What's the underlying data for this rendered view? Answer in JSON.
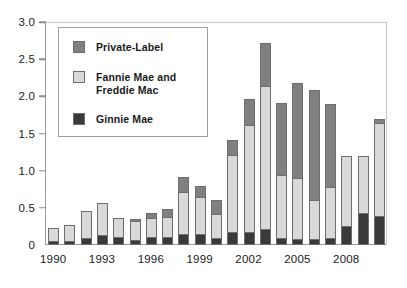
{
  "chart_data": {
    "type": "bar",
    "subtype": "stacked-vertical",
    "title": "",
    "subtitle": "",
    "xlabel": "",
    "ylabel": "",
    "ylim": [
      0,
      3.0
    ],
    "ytick_values": [
      0,
      0.5,
      1.0,
      1.5,
      2.0,
      2.5,
      3.0
    ],
    "ytick_labels": [
      "0",
      "0.5",
      "1.0",
      "1.5",
      "2.0",
      "2.5",
      "3.0"
    ],
    "grid": false,
    "legend_position": "upper-left-inside",
    "categories": [
      "1990",
      "1991",
      "1992",
      "1993",
      "1994",
      "1995",
      "1996",
      "1997",
      "1998",
      "1999",
      "2000",
      "2001",
      "2002",
      "2003",
      "2004",
      "2005",
      "2006",
      "2007",
      "2008",
      "2009",
      "2010"
    ],
    "xtick_labels_shown": [
      "1990",
      "1993",
      "1996",
      "1999",
      "2002",
      "2005",
      "2008"
    ],
    "series": [
      {
        "name": "Ginnie Mae",
        "color": "#3a3a3a",
        "values": [
          0.06,
          0.06,
          0.09,
          0.14,
          0.11,
          0.07,
          0.11,
          0.11,
          0.15,
          0.15,
          0.1,
          0.17,
          0.17,
          0.22,
          0.09,
          0.08,
          0.08,
          0.09,
          0.26,
          0.43,
          0.39
        ]
      },
      {
        "name": "Fannie Mae and Freddie Mac",
        "color": "#d9d9d9",
        "values": [
          0.17,
          0.21,
          0.37,
          0.42,
          0.25,
          0.25,
          0.25,
          0.27,
          0.57,
          0.5,
          0.32,
          1.04,
          1.44,
          1.92,
          0.85,
          0.82,
          0.53,
          0.69,
          0.94,
          0.77,
          1.25
        ]
      },
      {
        "name": "Private-Label",
        "color": "#808080",
        "values": [
          0.0,
          0.0,
          0.0,
          0.0,
          0.0,
          0.03,
          0.07,
          0.1,
          0.2,
          0.14,
          0.18,
          0.2,
          0.35,
          0.58,
          0.97,
          1.28,
          1.47,
          1.12,
          0.0,
          0.0,
          0.06
        ]
      }
    ]
  },
  "legend": {
    "items": [
      {
        "label": "Private-Label",
        "color": "#808080"
      },
      {
        "label": "Fannie Mae and\nFreddie Mac",
        "color": "#d9d9d9"
      },
      {
        "label": "Ginnie Mae",
        "color": "#3a3a3a"
      }
    ]
  },
  "axes": {
    "y_max": 3.0,
    "y_min": 0
  }
}
